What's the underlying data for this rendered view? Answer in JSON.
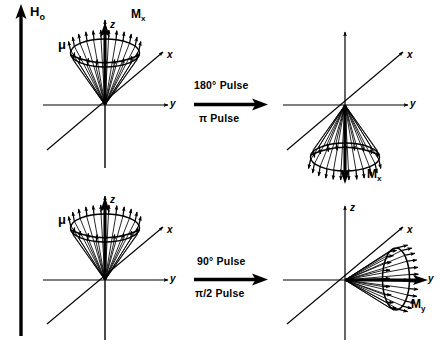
{
  "figure": {
    "field_label": "H",
    "field_sub": "o",
    "panels": [
      {
        "id": "top-left",
        "state": "equilibrium-cone-up",
        "mu_label": "μ",
        "magnetization_label": "M",
        "magnetization_sub": "x",
        "axes": {
          "z": "z",
          "x": "x",
          "y": "y"
        }
      },
      {
        "id": "top-right",
        "state": "inverted-cone-down",
        "mu_label": "",
        "magnetization_label": "M",
        "magnetization_sub": "x",
        "axes": {
          "z": "z",
          "x": "x",
          "y": "y"
        }
      },
      {
        "id": "bottom-left",
        "state": "equilibrium-cone-up",
        "mu_label": "μ",
        "magnetization_label": "",
        "magnetization_sub": "",
        "axes": {
          "z": "z",
          "x": "x",
          "y": "y"
        }
      },
      {
        "id": "bottom-right",
        "state": "cone-along-y",
        "mu_label": "",
        "magnetization_label": "M",
        "magnetization_sub": "y",
        "axes": {
          "z": "z",
          "x": "x",
          "y": "y"
        }
      }
    ],
    "transitions": [
      {
        "id": "top",
        "above": "180° Pulse",
        "below": "π Pulse"
      },
      {
        "id": "bottom",
        "above": "90° Pulse",
        "below": "π/2 Pulse"
      }
    ],
    "colors": {
      "ink": "#000000",
      "background": "#ffffff"
    }
  }
}
